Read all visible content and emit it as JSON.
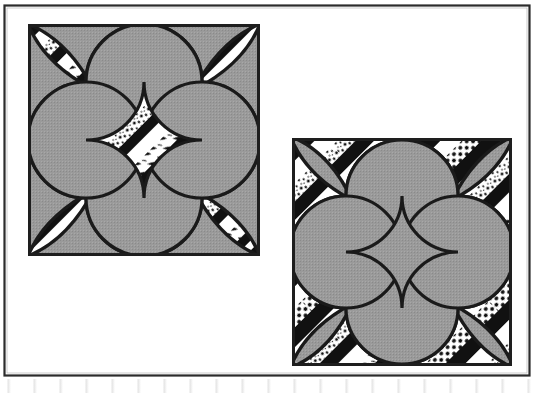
{
  "figure": {
    "title": "Two quilt block patterns",
    "caption": "",
    "medium": "black-and-white line illustration, scanned page",
    "background_color": "#ffffff",
    "ink_color": "#1a1a1a",
    "gray_fill_color": "#999999",
    "frame": {
      "label": "illustration-border-frame",
      "x": 4,
      "y": 5,
      "width": 526,
      "height": 371,
      "stroke_color": "#2b2b2b",
      "stroke_width": 2,
      "fill": "#ffffff"
    },
    "blocks": [
      {
        "id": "block-left",
        "name": "Double Wedding Ring / Orange Peel block, gray ground",
        "position": "upper-left",
        "x": 28,
        "y": 24,
        "width": 232,
        "height": 232,
        "ground": "gray",
        "ground_color": "#999999",
        "petals": "striped",
        "stripe_colors": [
          "#111111",
          "#ffffff"
        ],
        "corner_petal_count": 4,
        "ring_count": 4,
        "border_stroke": "#1e1e1e",
        "border_width": 3,
        "description": "Four overlapping circles on a solid gray ground; the circle rims and the four diagonal corner petals are pieced with black, white and printed stripes."
      },
      {
        "id": "block-right",
        "name": "Double Wedding Ring / Orange Peel block, striped ground",
        "position": "lower-right",
        "x": 292,
        "y": 138,
        "width": 220,
        "height": 228,
        "ground": "striped",
        "ground_color": "#ffffff",
        "petals": "gray",
        "petal_color": "#999999",
        "stripe_colors": [
          "#111111",
          "#ffffff"
        ],
        "stripe_angle_degrees": 45,
        "corner_petal_count": 4,
        "ring_count": 4,
        "border_stroke": "#1e1e1e",
        "border_width": 3,
        "description": "Colour reversal of the left block: solid gray melon and petal shapes float over a ground of 45-degree black, white, polka-dot and printed stripes."
      }
    ],
    "stripe_fabrics": [
      "solid black",
      "plain white",
      "polka dot",
      "small floral print",
      "speckled print",
      "fine line print"
    ]
  }
}
